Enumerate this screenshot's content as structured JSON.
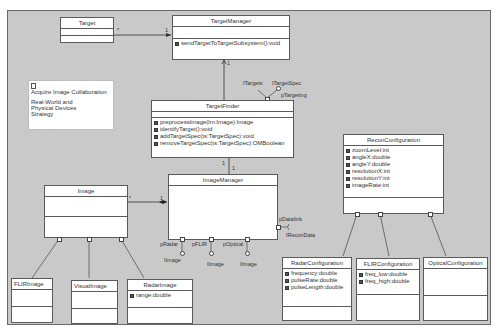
{
  "diagram": {
    "type": "UML class diagram",
    "note": {
      "icon": "note-icon",
      "title": "Acquire Image Collaboration",
      "text": "Real-World and Physical Devices Strategy"
    },
    "classes": {
      "target": {
        "name": "Target",
        "attributes": [],
        "operations": []
      },
      "target_manager": {
        "name": "TargetManager",
        "attributes": [],
        "operations": [
          "sendTargetToTargetSubsystem():void"
        ]
      },
      "target_finder": {
        "name": "TargetFinder",
        "attributes": [],
        "operations": [
          "preprocessImage(lm:Image):Image",
          "identifyTarget():void",
          "addTargetSpec(ts:TargetSpec):void",
          "removeTargetSpec(ts:TargetSpec):OMBoolean"
        ]
      },
      "image_manager": {
        "name": "ImageManager",
        "attributes": [],
        "operations": []
      },
      "image": {
        "name": "Image",
        "attributes": [],
        "operations": []
      },
      "flir_image": {
        "name": "FLIRImage",
        "attributes": [],
        "operations": []
      },
      "visual_image": {
        "name": "VisualImage",
        "attributes": [],
        "operations": []
      },
      "radar_image": {
        "name": "RadarImage",
        "attributes": [
          "range:double"
        ],
        "operations": []
      },
      "recon_configuration": {
        "name": "ReconConfiguration",
        "attributes": [
          "zoomLevel:int",
          "angleX:double",
          "angleY:double",
          "resolutionX:int",
          "resolutionY:int",
          "imageRate:int"
        ],
        "operations": []
      },
      "radar_configuration": {
        "name": "RadarConfiguration",
        "attributes": [
          "frequency:double",
          "pulseRate:double",
          "pulseLength:double"
        ],
        "operations": []
      },
      "flir_configuration": {
        "name": "FLIRConfiguration",
        "attributes": [
          "freq_low:double",
          "freq_high:double"
        ],
        "operations": []
      },
      "optical_configuration": {
        "name": "OpticalConfiguration",
        "attributes": [],
        "operations": []
      }
    },
    "ports": {
      "p_targeting": "pTargeting",
      "i_targets": "ITargets",
      "i_target_spec": "ITargetSpec",
      "p_radar": "pRadar",
      "p_flir": "pFLIR",
      "p_optical": "pOptical",
      "i_image_1": "IImage",
      "i_image_2": "IImage",
      "i_image_3": "IImage",
      "p_datalink": "pDatalink",
      "i_recon_data": "IReconData"
    },
    "multiplicities": {
      "target_to_manager_source": "*",
      "target_to_manager_target": "1",
      "finder_to_manager": "1",
      "finder_to_imagemanager_a": "1",
      "finder_to_imagemanager_b": "1",
      "image_to_imagemanager_source": "*",
      "image_to_imagemanager_target": "1"
    }
  }
}
